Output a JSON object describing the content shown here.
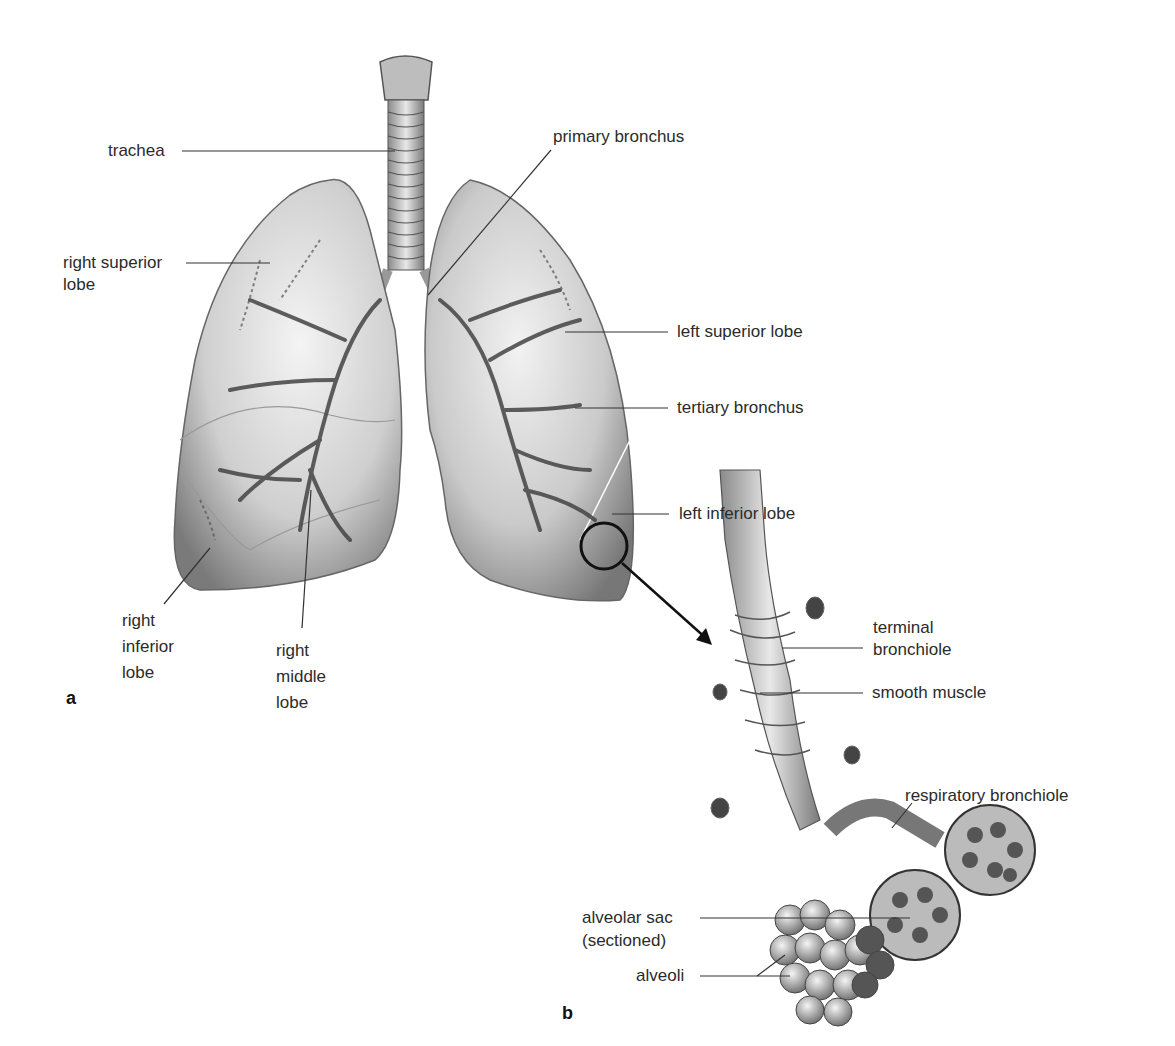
{
  "figure": {
    "panel_a": {
      "label": "a",
      "labels": {
        "trachea": "trachea",
        "primary_bronchus": "primary bronchus",
        "right_superior_lobe_1": "right superior",
        "right_superior_lobe_2": "lobe",
        "left_superior_lobe": "left superior lobe",
        "tertiary_bronchus": "tertiary bronchus",
        "left_inferior_lobe": "left inferior lobe",
        "right_inferior_lobe_1": "right",
        "right_inferior_lobe_2": "inferior",
        "right_inferior_lobe_3": "lobe",
        "right_middle_lobe_1": "right",
        "right_middle_lobe_2": "middle",
        "right_middle_lobe_3": "lobe"
      }
    },
    "panel_b": {
      "label": "b",
      "labels": {
        "terminal_bronchiole_1": "terminal",
        "terminal_bronchiole_2": "bronchiole",
        "smooth_muscle": "smooth muscle",
        "respiratory_bronchiole": "respiratory bronchiole",
        "alveolar_sac_1": "alveolar sac",
        "alveolar_sac_2": "(sectioned)",
        "alveoli": "alveoli"
      }
    },
    "colors": {
      "leader_line": "#333333",
      "lung_shade": "#c8c8c8",
      "lung_dark": "#6e6e6e"
    }
  }
}
